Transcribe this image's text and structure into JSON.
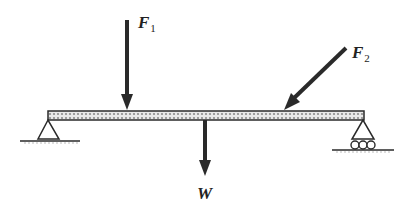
{
  "diagram": {
    "type": "simply-supported beam free-body diagram",
    "labels": {
      "f1": {
        "main": "F",
        "sub": "1"
      },
      "f2": {
        "main": "F",
        "sub": "2"
      },
      "w": {
        "main": "W"
      }
    },
    "colors": {
      "ink": "#2a2a2a",
      "beam_fill": "#bdbdbd"
    },
    "elements": {
      "beam": "horizontal beam",
      "left_support": "pin support (triangle)",
      "right_support": "roller support (triangle on rollers)",
      "force_f1": "vertical downward force",
      "force_f2": "inclined force pointing down-left",
      "force_w": "weight acting downward from beam center"
    }
  }
}
